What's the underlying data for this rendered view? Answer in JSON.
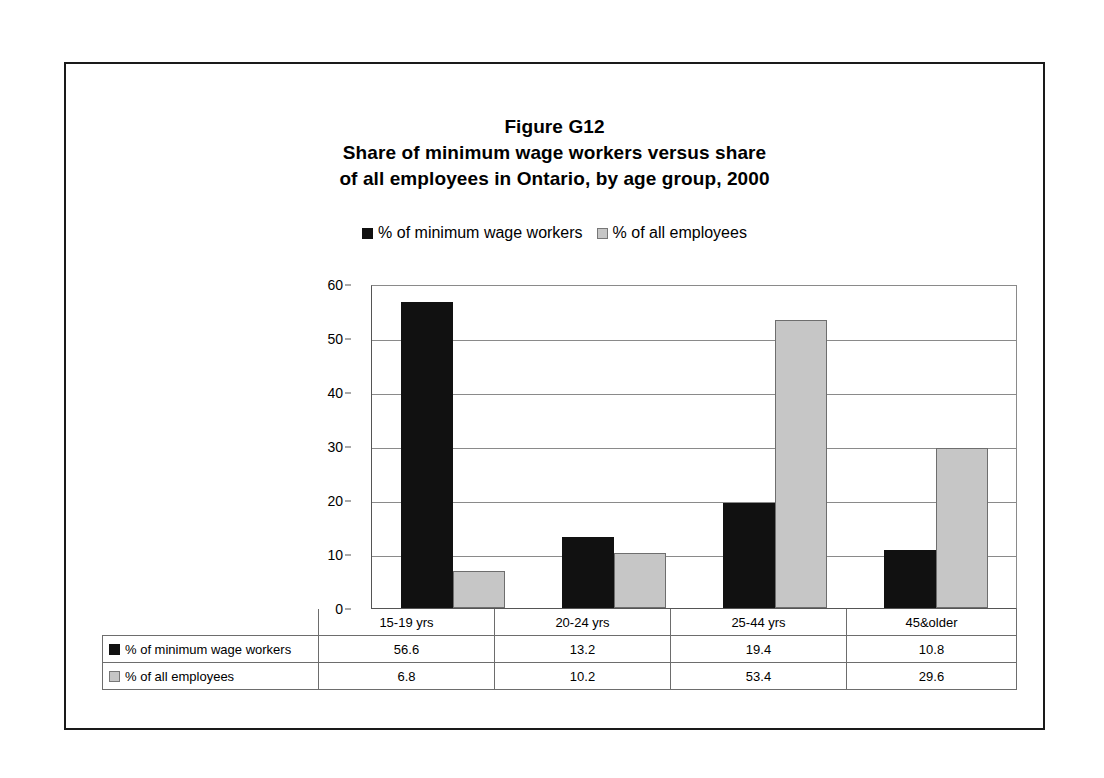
{
  "figure": {
    "title_lines": [
      "Figure G12",
      "Share of minimum wage workers versus share",
      "of all employees in Ontario, by age group, 2000"
    ]
  },
  "legend": {
    "entries": [
      {
        "label": "% of minimum wage workers",
        "swatch": "dark-square-swatch",
        "color": "#111111"
      },
      {
        "label": "% of all employees",
        "swatch": "light-square-swatch",
        "color": "#c6c6c6"
      }
    ]
  },
  "chart_data": {
    "type": "bar",
    "title": "Share of minimum wage workers versus share of all employees in Ontario, by age group, 2000",
    "subtitle": "Figure G12",
    "xlabel": "",
    "ylabel": "",
    "categories": [
      "15-19 yrs",
      "20-24 yrs",
      "25-44 yrs",
      "45&older"
    ],
    "series": [
      {
        "name": "% of minimum wage workers",
        "color": "#111111",
        "values": [
          56.6,
          13.2,
          19.4,
          10.8
        ]
      },
      {
        "name": "% of all employees",
        "color": "#c6c6c6",
        "values": [
          6.8,
          10.2,
          53.4,
          29.6
        ]
      }
    ],
    "ylim": [
      0,
      60
    ],
    "yticks": [
      0,
      10,
      20,
      30,
      40,
      50,
      60
    ],
    "ytick_labels": [
      "0",
      "10",
      "20",
      "30",
      "40",
      "50",
      "60"
    ],
    "grid": true,
    "legend_position": "top-center",
    "data_table_visible": true
  },
  "table": {
    "corner": "",
    "column_headers": [
      "15-19 yrs",
      "20-24 yrs",
      "25-44 yrs",
      "45&older"
    ],
    "rows": [
      {
        "label": "% of minimum wage workers",
        "swatch": "dark-square-swatch",
        "values": [
          "56.6",
          "13.2",
          "19.4",
          "10.8"
        ]
      },
      {
        "label": "% of all employees",
        "swatch": "light-square-swatch",
        "values": [
          "6.8",
          "10.2",
          "53.4",
          "29.6"
        ]
      }
    ]
  }
}
